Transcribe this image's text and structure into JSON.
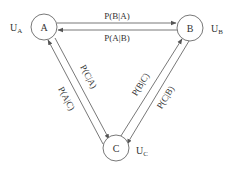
{
  "diagram": {
    "type": "state-transition-graph",
    "nodes": [
      {
        "id": "A",
        "label": "A",
        "utility": "U",
        "utility_sub": "A"
      },
      {
        "id": "B",
        "label": "B",
        "utility": "U",
        "utility_sub": "B"
      },
      {
        "id": "C",
        "label": "C",
        "utility": "U",
        "utility_sub": "C"
      }
    ],
    "edges": [
      {
        "from": "A",
        "to": "B",
        "label": "P(B|A)"
      },
      {
        "from": "B",
        "to": "A",
        "label": "P(A|B)"
      },
      {
        "from": "C",
        "to": "A",
        "label": "P(A|C)"
      },
      {
        "from": "A",
        "to": "C",
        "label": "P(C|A)"
      },
      {
        "from": "C",
        "to": "B",
        "label": "P(B|C)"
      },
      {
        "from": "B",
        "to": "C",
        "label": "P(C|B)"
      }
    ]
  },
  "colors": {
    "line": "#555555",
    "text": "#333333",
    "background": "#ffffff"
  }
}
